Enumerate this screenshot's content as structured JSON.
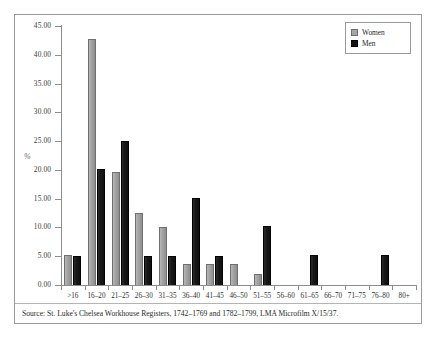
{
  "figure": {
    "y_axis_title": "%",
    "source_note": "Source: St. Luke's Chelsea Workhouse Registers, 1742–1769 and 1782–1799, LMA Microfilm X/15/37."
  },
  "legend": {
    "position": "top-right",
    "entries": [
      {
        "label": "Women",
        "color": "#a6a6a6",
        "swatch_name": "legend-swatch-women"
      },
      {
        "label": "Men",
        "color": "#141414",
        "swatch_name": "legend-swatch-men"
      }
    ]
  },
  "chart_data": {
    "type": "bar",
    "title": "",
    "subtitle": "",
    "xlabel": "",
    "ylabel": "%",
    "ylim": [
      0,
      45
    ],
    "ytick_step": 5,
    "ytick_labels": [
      "0.00",
      "5.00",
      "10.00",
      "15.00",
      "20.00",
      "25.00",
      "30.00",
      "35.00",
      "40.00",
      "45.00"
    ],
    "ytick_values": [
      0,
      5,
      10,
      15,
      20,
      25,
      30,
      35,
      40,
      45
    ],
    "grid": false,
    "legend_position": "top-right",
    "categories": [
      "&gt;16",
      "16–20",
      "21–25",
      "26–30",
      "31–35",
      "36–40",
      "41–45",
      "46–50",
      "51–55",
      "56–60",
      "61–65",
      "66–70",
      "71–75",
      "76–80",
      "80+"
    ],
    "series": [
      {
        "name": "Women",
        "color": "#a6a6a6",
        "values": [
          5.3,
          42.8,
          19.7,
          12.5,
          10.1,
          3.7,
          3.7,
          3.7,
          2.0,
          0,
          0,
          0,
          0,
          0,
          0
        ]
      },
      {
        "name": "Men",
        "color": "#141414",
        "values": [
          5.0,
          20.1,
          25.0,
          5.0,
          5.0,
          15.1,
          5.1,
          0,
          10.2,
          0,
          5.2,
          0,
          0,
          5.2,
          0
        ]
      }
    ],
    "annotations": [
      "Source: St. Luke's Chelsea Workhouse Registers, 1742–1769 and 1782–1799, LMA Microfilm X/15/37."
    ]
  }
}
